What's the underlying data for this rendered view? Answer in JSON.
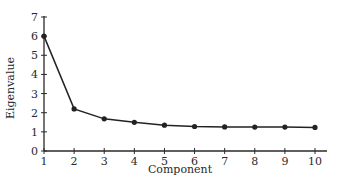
{
  "chart_data": {
    "type": "line",
    "title": "",
    "xlabel": "Component",
    "ylabel": "Eigenvalue",
    "x": [
      1,
      2,
      3,
      4,
      5,
      6,
      7,
      8,
      9,
      10
    ],
    "categories": [
      "1",
      "2",
      "3",
      "4",
      "5",
      "6",
      "7",
      "8",
      "9",
      "10"
    ],
    "series": [
      {
        "name": "Eigenvalue",
        "values": [
          6.0,
          2.2,
          1.68,
          1.5,
          1.35,
          1.28,
          1.26,
          1.25,
          1.25,
          1.23
        ],
        "marker": "circle",
        "color": "#222222"
      }
    ],
    "xlim": [
      1,
      10
    ],
    "ylim": [
      0,
      7
    ],
    "yticks": [
      0,
      1,
      2,
      3,
      4,
      5,
      6,
      7
    ],
    "xticks": [
      1,
      2,
      3,
      4,
      5,
      6,
      7,
      8,
      9,
      10
    ],
    "grid": false,
    "legend": null
  },
  "axes": {
    "xlabel": "Component",
    "ylabel": "Eigenvalue"
  }
}
